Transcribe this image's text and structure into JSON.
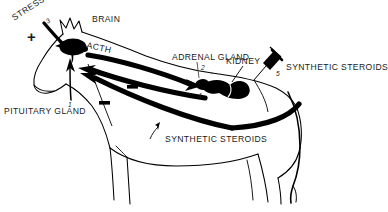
{
  "diagram": {
    "background_color": "#ffffff",
    "ink_color": "#000000",
    "labels": {
      "stress": "STRESS",
      "brain": "BRAIN",
      "acth": "ACTH",
      "pituitary_gland": "PITUITARY GLAND",
      "adrenal_gland": "ADRENAL GLAND",
      "kidney": "KIDNEY",
      "synthetic_steroids_right": "SYNTHETIC STEROIDS",
      "synthetic_steroids_bottom": "SYNTHETIC STEROIDS"
    },
    "markers": {
      "one": "1",
      "two": "2",
      "three": "3",
      "four": "4",
      "five": "5"
    },
    "signs": {
      "plus": "+",
      "minus_upper": "—",
      "minus_lower": "—",
      "minus_pituitary": "—"
    },
    "organs": [
      {
        "name": "pituitary-gland",
        "marker": "1",
        "shape": "filled-blob"
      },
      {
        "name": "adrenal-gland",
        "marker": "2",
        "shape": "filled-blob"
      },
      {
        "name": "kidney",
        "marker": "4",
        "shape": "filled-blob"
      }
    ],
    "icons": {
      "syringe": "syringe-icon",
      "stress_arrow": "stress-arrow-icon"
    },
    "flows": [
      {
        "name": "acth-flow",
        "from": "pituitary-gland",
        "to": "adrenal-gland",
        "sign": "+"
      },
      {
        "name": "cortisol-negative-feedback",
        "from": "adrenal-gland",
        "to": "pituitary-gland",
        "sign": "—"
      },
      {
        "name": "synthetic-steroid-negative-feedback",
        "from": "synthetic-steroids",
        "to": "pituitary-gland",
        "sign": "—"
      },
      {
        "name": "stress-stimulus",
        "from": "stress",
        "to": "pituitary-gland",
        "sign": "+"
      }
    ]
  }
}
